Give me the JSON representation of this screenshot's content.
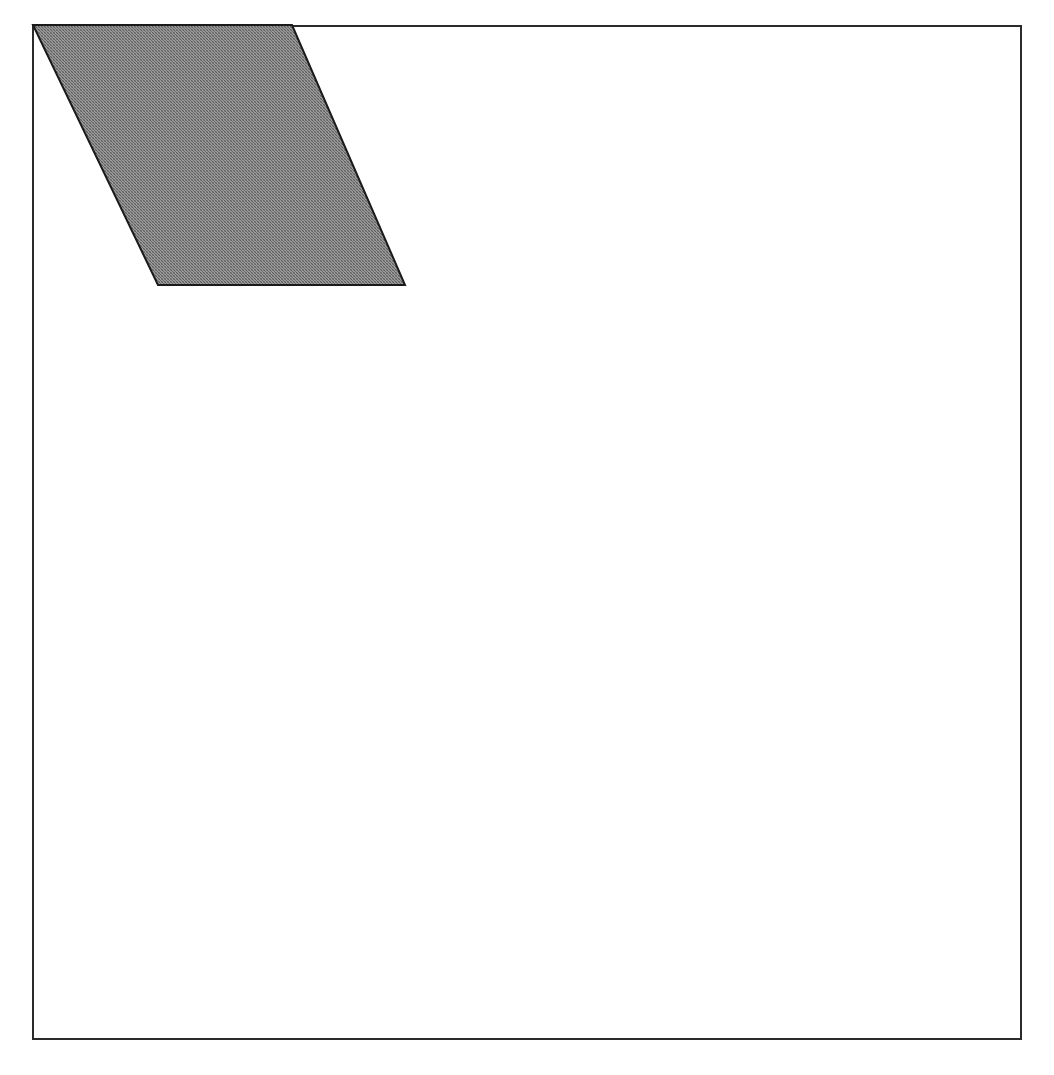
{
  "page": {
    "background_color": "#ffffff",
    "width": 1054,
    "height": 1075
  },
  "frame": {
    "name": "figure-border",
    "stroke_color": "#2b2b2b",
    "stroke_width": 2,
    "fill": "none",
    "left": 33,
    "top": 26,
    "right": 1021,
    "bottom": 1039
  },
  "caption": {
    "text": "",
    "visible": false
  },
  "chart_data": {
    "type": "diagram",
    "title": "",
    "subtitle": "",
    "xlabel": "",
    "ylabel": "",
    "grid": false,
    "legend": "none",
    "axis_visible": false,
    "background_color": "#ffffff",
    "plot_area": {
      "x": 33,
      "y": 26,
      "width": 988,
      "height": 1013,
      "border_color": "#2b2b2b",
      "border_width": 2,
      "fill": "#ffffff"
    },
    "shapes": [
      {
        "name": "shaded-parallelogram",
        "type": "parallelogram",
        "fill_color": "#808080",
        "fill_pattern": "halftone-dither",
        "stroke_color": "#1a1a1a",
        "stroke_width": 2,
        "points": [
          [
            33,
            25
          ],
          [
            292,
            25
          ],
          [
            405,
            285
          ],
          [
            158,
            285
          ]
        ],
        "points_label": "top-left, top-right, bottom-right, bottom-left",
        "width_top": 259,
        "height": 260,
        "shear_offset_x": 113
      }
    ],
    "annotations": []
  }
}
